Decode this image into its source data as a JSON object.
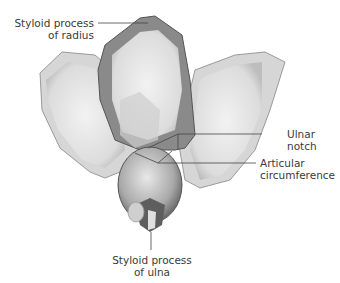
{
  "labels": {
    "styloid_radius": {
      "line1": "Styloid process",
      "line2": "of radius"
    },
    "ulnar_notch": {
      "line1": "Ulnar",
      "line2": "notch"
    },
    "articular_circumference": {
      "line1": "Articular",
      "line2": "circumference"
    },
    "styloid_ulna": {
      "line1": "Styloid process",
      "line2": "of ulna"
    }
  },
  "colors": {
    "bone_dark": "#6e6e6e",
    "bone_mid": "#b8b8b8",
    "bone_light": "#e4e4e4",
    "leader": "#444444"
  }
}
